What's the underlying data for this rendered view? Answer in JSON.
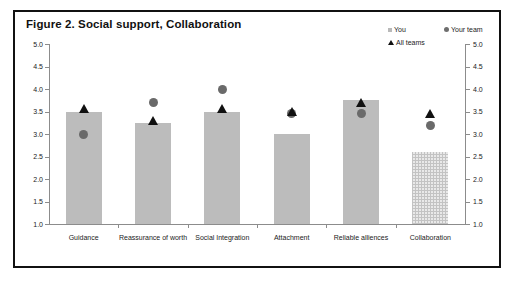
{
  "figure": {
    "title": "Figure 2. Social support, Collaboration"
  },
  "legend": {
    "items": [
      {
        "label": "You",
        "marker": "square-marker",
        "color": "#b9b9b9"
      },
      {
        "label": "Your team",
        "marker": "circle-marker",
        "color": "#6e6e6e"
      },
      {
        "label": "All teams",
        "marker": "triangle-marker",
        "color": "#111111"
      }
    ]
  },
  "axis": {
    "tick_labels": [
      "5.0",
      "4.5",
      "4.0",
      "3.5",
      "3.0",
      "2.5",
      "2.0",
      "1.5",
      "1.0"
    ],
    "left_label": "",
    "right_label": ""
  },
  "chart_data": {
    "type": "bar",
    "title": "Figure 2. Social support, Collaboration",
    "xlabel": "",
    "ylabel": "",
    "ylim": [
      1.0,
      5.0
    ],
    "ytick_step": 0.5,
    "grid": false,
    "legend_position": "top-right",
    "dual_axis": true,
    "categories": [
      "Guidance",
      "Reassurance of worth",
      "Social Integration",
      "Attachment",
      "Reliable alliences",
      "Collaboration"
    ],
    "series": [
      {
        "name": "You",
        "type": "bar",
        "values": [
          3.5,
          3.25,
          3.5,
          3.0,
          3.75,
          2.6
        ]
      },
      {
        "name": "Your team",
        "type": "scatter",
        "values": [
          3.0,
          3.7,
          4.0,
          3.45,
          3.45,
          3.2
        ]
      },
      {
        "name": "All teams",
        "type": "scatter",
        "values": [
          3.55,
          3.3,
          3.55,
          3.5,
          3.7,
          3.45
        ]
      }
    ]
  }
}
